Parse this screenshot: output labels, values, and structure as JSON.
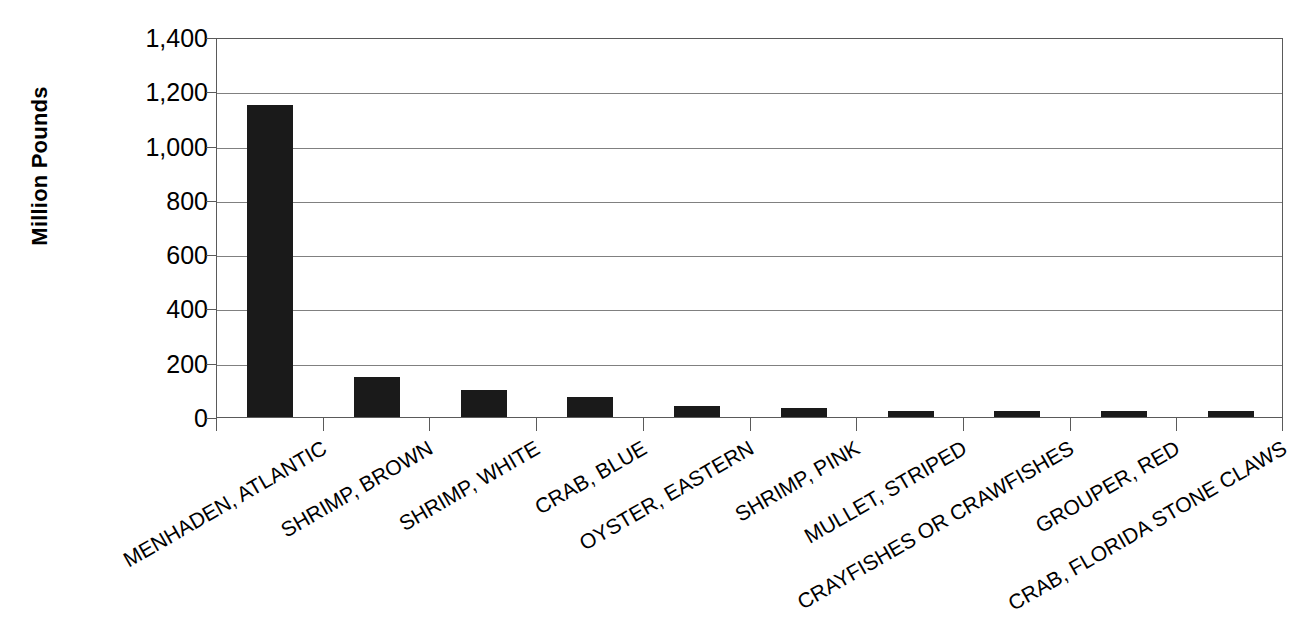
{
  "chart_data": {
    "type": "bar",
    "title": "",
    "subtitle": "",
    "xlabel": "",
    "ylabel": "Million Pounds",
    "ylim": [
      0,
      1400
    ],
    "ytick_step": 200,
    "grid": true,
    "legend": false,
    "orientation": "vertical",
    "bar_color": "#1a1a1a",
    "categories": [
      "MENHADEN, ATLANTIC",
      "SHRIMP, BROWN",
      "SHRIMP, WHITE",
      "CRAB, BLUE",
      "OYSTER, EASTERN",
      "SHRIMP, PINK",
      "MULLET, STRIPED",
      "CRAYFISHES OR CRAWFISHES",
      "GROUPER, RED",
      "CRAB, FLORIDA STONE CLAWS"
    ],
    "values": [
      1150,
      147,
      100,
      73,
      40,
      32,
      22,
      22,
      24,
      24
    ],
    "ytick_labels": [
      "1,400",
      "1,200",
      "1,000",
      "800",
      "600",
      "400",
      "200",
      "0"
    ],
    "ytick_values": [
      1400,
      1200,
      1000,
      800,
      600,
      400,
      200,
      0
    ]
  },
  "axis": {
    "y_title": "Million Pounds"
  }
}
